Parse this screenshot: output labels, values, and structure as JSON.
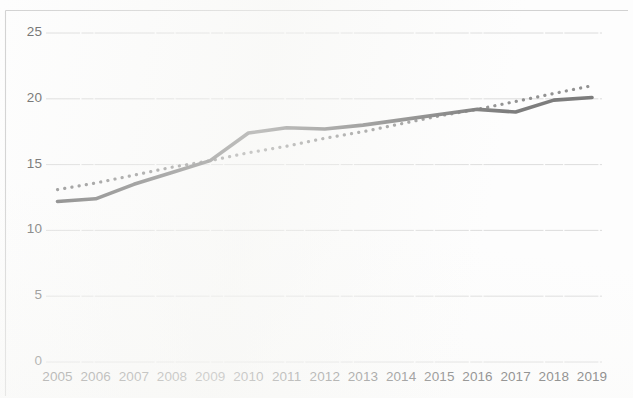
{
  "chart_data": {
    "type": "line",
    "title": "",
    "subtitle": "",
    "xlabel": "",
    "ylabel": "",
    "categories": [
      "2005",
      "2006",
      "2007",
      "2008",
      "2009",
      "2010",
      "2011",
      "2012",
      "2013",
      "2014",
      "2015",
      "2016",
      "2017",
      "2018",
      "2019"
    ],
    "x": [
      2005,
      2006,
      2007,
      2008,
      2009,
      2010,
      2011,
      2012,
      2013,
      2014,
      2015,
      2016,
      2017,
      2018,
      2019
    ],
    "series": [
      {
        "name": "data-line",
        "style": "solid",
        "color": "#6b6b6b",
        "values": [
          12.2,
          12.4,
          13.5,
          14.4,
          15.3,
          17.4,
          17.8,
          17.7,
          18.0,
          18.4,
          18.8,
          19.2,
          19.0,
          19.9,
          20.1
        ]
      },
      {
        "name": "trendline",
        "style": "dotted",
        "color": "#7a7a7a",
        "values": [
          13.1,
          13.6,
          14.2,
          14.8,
          15.3,
          15.9,
          16.4,
          17.0,
          17.5,
          18.1,
          18.7,
          19.2,
          19.8,
          20.4,
          21.0
        ]
      }
    ],
    "ylim": [
      0,
      25
    ],
    "yticks": [
      0,
      5,
      10,
      15,
      20,
      25
    ],
    "ytick_labels": [
      "0",
      "5",
      "10",
      "15",
      "20",
      "25"
    ],
    "xtick_labels": [
      "2005",
      "2006",
      "2007",
      "2008",
      "2009",
      "2010",
      "2011",
      "2012",
      "2013",
      "2014",
      "2015",
      "2016",
      "2017",
      "2018",
      "2019"
    ],
    "grid": true,
    "grid_axis": "y",
    "grid_color": "#d8d8d8",
    "legend": "none",
    "legend_position": "none",
    "background_color": "#ffffff",
    "border": true,
    "border_color": "#cfcfcf",
    "annotations": []
  },
  "axes": {
    "y_ticks": [
      {
        "label": "25",
        "value": 25
      },
      {
        "label": "20",
        "value": 20
      },
      {
        "label": "15",
        "value": 15
      },
      {
        "label": "10",
        "value": 10
      },
      {
        "label": "5",
        "value": 5
      },
      {
        "label": "0",
        "value": 0
      }
    ],
    "x_ticks": [
      {
        "label": "2005"
      },
      {
        "label": "2006"
      },
      {
        "label": "2007"
      },
      {
        "label": "2008"
      },
      {
        "label": "2009"
      },
      {
        "label": "2010"
      },
      {
        "label": "2011"
      },
      {
        "label": "2012"
      },
      {
        "label": "2013"
      },
      {
        "label": "2014"
      },
      {
        "label": "2015"
      },
      {
        "label": "2016"
      },
      {
        "label": "2017"
      },
      {
        "label": "2018"
      },
      {
        "label": "2019"
      }
    ]
  }
}
